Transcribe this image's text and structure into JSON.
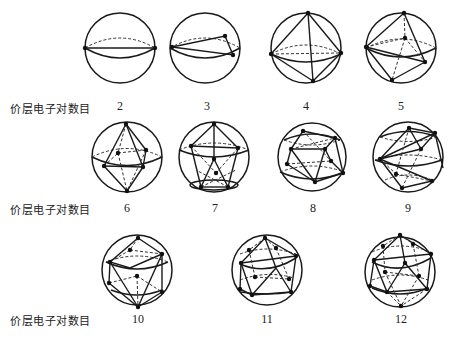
{
  "figure": {
    "row_label": "价层电子对数目",
    "rows": [
      {
        "label_y": 101,
        "items": [
          {
            "count": "2",
            "geometry": "linear",
            "cx": 120,
            "cy": 48,
            "label_y": 101
          },
          {
            "count": "3",
            "geometry": "trigonal-planar",
            "cx": 205,
            "cy": 48,
            "label_y": 101
          },
          {
            "count": "4",
            "geometry": "tetrahedral",
            "cx": 306,
            "cy": 48,
            "label_y": 101
          },
          {
            "count": "5",
            "geometry": "trigonal-bipyramidal",
            "cx": 401,
            "cy": 48,
            "label_y": 101
          }
        ]
      },
      {
        "label_y": 202,
        "items": [
          {
            "count": "6",
            "geometry": "octahedral",
            "cx": 127,
            "cy": 157,
            "label_y": 202
          },
          {
            "count": "7",
            "geometry": "pentagonal-bipyramidal",
            "cx": 214,
            "cy": 157,
            "label_y": 202
          },
          {
            "count": "8",
            "geometry": "square-antiprismatic",
            "cx": 312,
            "cy": 155,
            "label_y": 202
          },
          {
            "count": "9",
            "geometry": "tricapped-trigonal-prismatic",
            "cx": 408,
            "cy": 157,
            "label_y": 202
          }
        ]
      },
      {
        "label_y": 313,
        "items": [
          {
            "count": "10",
            "geometry": "bicapped-square-antiprismatic",
            "cx": 137,
            "cy": 270,
            "label_y": 313
          },
          {
            "count": "11",
            "geometry": "octadecahedral",
            "cx": 267,
            "cy": 270,
            "label_y": 313
          },
          {
            "count": "12",
            "geometry": "icosahedral",
            "cx": 400,
            "cy": 270,
            "label_y": 313
          }
        ]
      }
    ]
  },
  "labels": {
    "row1": "价层电子对数目",
    "row2": "价层电子对数目",
    "row3": "价层电子对数目",
    "n2": "2",
    "n3": "3",
    "n4": "4",
    "n5": "5",
    "n6": "6",
    "n7": "7",
    "n8": "8",
    "n9": "9",
    "n10": "10",
    "n11": "11",
    "n12": "12"
  },
  "colors": {
    "line": "#1a1a1a",
    "background": "#ffffff"
  }
}
